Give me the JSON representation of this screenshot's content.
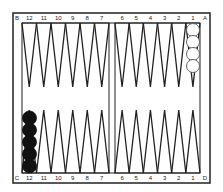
{
  "board": {
    "corner_labels": {
      "top_left": "B",
      "top_right": "A",
      "bottom_left": "C",
      "bottom_right": "D"
    },
    "top_left_points": [
      "12",
      "11",
      "10",
      "9",
      "8",
      "7"
    ],
    "top_right_points": [
      "6",
      "5",
      "4",
      "3",
      "2",
      "1"
    ],
    "bottom_left_points": [
      "12",
      "11",
      "10",
      "9",
      "8",
      "7"
    ],
    "bottom_right_points": [
      "6",
      "5",
      "4",
      "3",
      "2",
      "1"
    ],
    "colors": {
      "line": "#222222",
      "background": "#ffffff",
      "black_checker": "#111111",
      "white_checker": "#ffffff"
    }
  },
  "checkers": {
    "white": {
      "location": "top point 1",
      "count": 4
    },
    "black": {
      "location": "bottom point 12",
      "count": 5
    }
  }
}
